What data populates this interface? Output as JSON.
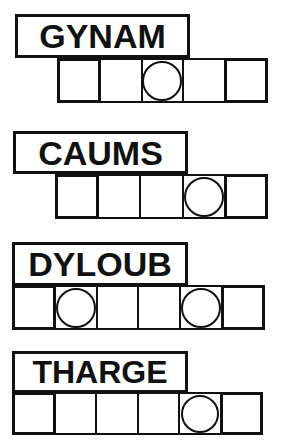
{
  "sheet": {
    "title": "Word Scramble Puzzle Sheet",
    "ink_color": "#111111",
    "paper_color": "#ffffff"
  },
  "puzzles": [
    {
      "id": "puzzle-1",
      "scrambled_word": "GYNAM",
      "letter_count": 5,
      "cells": 5,
      "circled_cells": [
        3
      ],
      "word_box": {
        "left": 15,
        "top": 14,
        "width": 175,
        "height": 44,
        "font_size": 34
      },
      "cell_row": {
        "left": 57,
        "top": 58,
        "width": 219,
        "height": 45,
        "cell_width": 43.8
      },
      "circle_size": 40
    },
    {
      "id": "puzzle-2",
      "scrambled_word": "CAUMS",
      "letter_count": 5,
      "cells": 5,
      "circled_cells": [
        4
      ],
      "word_box": {
        "left": 13,
        "top": 131,
        "width": 175,
        "height": 43,
        "font_size": 34
      },
      "cell_row": {
        "left": 55,
        "top": 174,
        "width": 221,
        "height": 45,
        "cell_width": 44.2
      },
      "circle_size": 40
    },
    {
      "id": "puzzle-3",
      "scrambled_word": "DYLOUB",
      "letter_count": 6,
      "cells": 6,
      "circled_cells": [
        2,
        5
      ],
      "word_box": {
        "left": 12,
        "top": 242,
        "width": 176,
        "height": 44,
        "font_size": 34
      },
      "cell_row": {
        "left": 12,
        "top": 285,
        "width": 263,
        "height": 45,
        "cell_width": 43.8
      },
      "circle_size": 40
    },
    {
      "id": "puzzle-4",
      "scrambled_word": "THARGE",
      "letter_count": 6,
      "cells": 6,
      "circled_cells": [
        5
      ],
      "word_box": {
        "left": 12,
        "top": 351,
        "width": 176,
        "height": 42,
        "font_size": 32
      },
      "cell_row": {
        "left": 12,
        "top": 392,
        "width": 261,
        "height": 43,
        "cell_width": 43.5
      },
      "circle_size": 38
    }
  ]
}
